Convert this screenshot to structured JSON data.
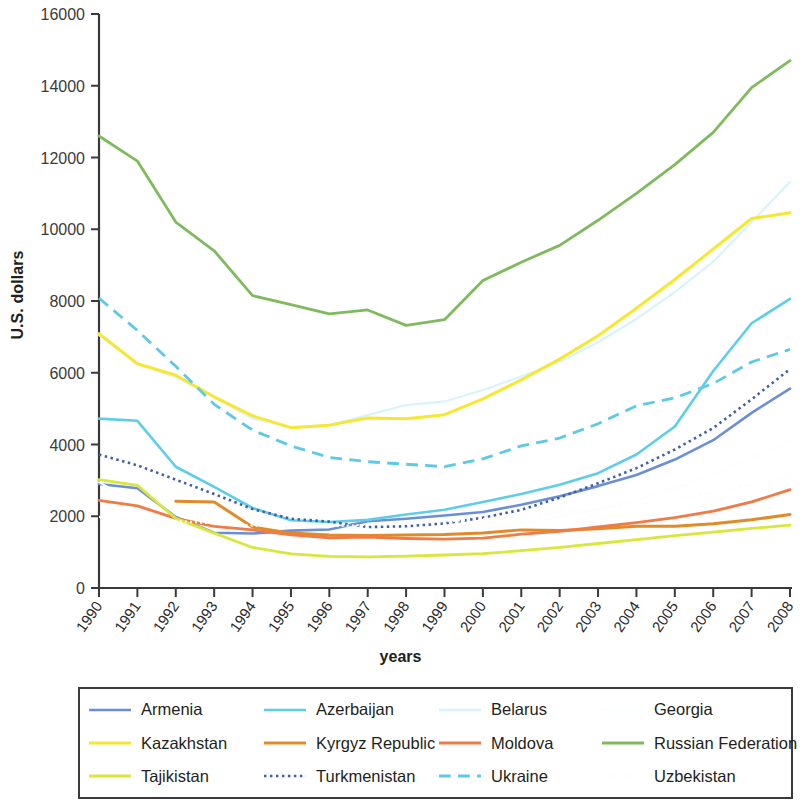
{
  "chart_data": {
    "type": "line",
    "title": "",
    "xlabel": "years",
    "ylabel": "U.S. dollars",
    "x": [
      1990,
      1991,
      1992,
      1993,
      1994,
      1995,
      1996,
      1997,
      1998,
      1999,
      2000,
      2001,
      2002,
      2003,
      2004,
      2005,
      2006,
      2007,
      2008
    ],
    "xtick_labels": [
      "1990",
      "1991",
      "1992",
      "1993",
      "1994",
      "1995",
      "1996",
      "1997",
      "1998",
      "1999",
      "2000",
      "2001",
      "2002",
      "2003",
      "2004",
      "2005",
      "2006",
      "2007",
      "2008"
    ],
    "ytick_labels": [
      "0",
      "2000",
      "4000",
      "6000",
      "8000",
      "10000",
      "12000",
      "14000",
      "16000"
    ],
    "ylim": [
      0,
      16000
    ],
    "ytick_step": 2000,
    "xlim": [
      1990,
      2008
    ],
    "grid": false,
    "legend_position": "bottom",
    "legend_columns": 4,
    "series": [
      {
        "name": "Armenia",
        "color": "#6a8fd8",
        "dash": "solid",
        "width": 2.6,
        "values": [
          2900,
          2780,
          1980,
          1540,
          1520,
          1600,
          1630,
          1860,
          1930,
          2020,
          2120,
          2320,
          2560,
          2840,
          3150,
          3580,
          4120,
          4880,
          5560
        ]
      },
      {
        "name": "Azerbaijan",
        "color": "#5ecdea",
        "dash": "solid",
        "width": 2.6,
        "values": [
          4720,
          4660,
          3380,
          2820,
          2230,
          1890,
          1840,
          1900,
          2050,
          2180,
          2400,
          2620,
          2880,
          3200,
          3720,
          4500,
          6050,
          7380,
          8060
        ]
      },
      {
        "name": "Belarus",
        "color": "#d8f4fb",
        "dash": "solid",
        "width": 2.2,
        "values": [
          7050,
          6250,
          5880,
          5320,
          4720,
          4480,
          4540,
          4820,
          5100,
          5200,
          5520,
          5900,
          6300,
          6850,
          7500,
          8250,
          9100,
          10200,
          11320
        ]
      },
      {
        "name": "Georgia",
        "color": "#fbfefe",
        "dash": "solid",
        "width": 2.0,
        "values": [
          2950,
          2350,
          1560,
          1300,
          1200,
          1230,
          1330,
          1450,
          1540,
          1560,
          1640,
          1800,
          1980,
          2200,
          2450,
          2780,
          3150,
          3620,
          4100
        ]
      },
      {
        "name": "Kazakhstan",
        "color": "#f7e733",
        "dash": "solid",
        "width": 3.0,
        "values": [
          7090,
          6250,
          5930,
          5330,
          4800,
          4470,
          4540,
          4740,
          4720,
          4830,
          5270,
          5800,
          6380,
          7030,
          7800,
          8600,
          9450,
          10300,
          10460
        ]
      },
      {
        "name": "Kyrgyz Republic",
        "color": "#e08b27",
        "dash": "solid",
        "width": 3.0,
        "values": [
          null,
          null,
          2420,
          2400,
          1700,
          1530,
          1480,
          1460,
          1480,
          1490,
          1530,
          1620,
          1600,
          1650,
          1720,
          1720,
          1790,
          1900,
          2050
        ]
      },
      {
        "name": "Moldova",
        "color": "#ef7b45",
        "dash": "solid",
        "width": 2.8,
        "values": [
          2440,
          2290,
          1940,
          1720,
          1620,
          1480,
          1400,
          1420,
          1380,
          1360,
          1390,
          1500,
          1580,
          1700,
          1820,
          1960,
          2140,
          2400,
          2740
        ]
      },
      {
        "name": "Russian Federation",
        "color": "#7fbb5e",
        "dash": "solid",
        "width": 2.8,
        "values": [
          12600,
          11900,
          10200,
          9400,
          8150,
          7900,
          7640,
          7750,
          7320,
          7480,
          8570,
          9080,
          9550,
          10250,
          11000,
          11800,
          12700,
          13950,
          14700
        ]
      },
      {
        "name": "Tajikistan",
        "color": "#d9e63c",
        "dash": "solid",
        "width": 2.8,
        "values": [
          3020,
          2860,
          1940,
          1530,
          1130,
          950,
          880,
          870,
          890,
          920,
          960,
          1040,
          1130,
          1240,
          1350,
          1460,
          1560,
          1660,
          1750
        ]
      },
      {
        "name": "Turkmenistan",
        "color": "#3f5ea8",
        "dash": "dotted",
        "width": 2.6,
        "values": [
          3720,
          3420,
          3020,
          2620,
          2200,
          1930,
          1850,
          1700,
          1720,
          1800,
          1960,
          2180,
          2520,
          2920,
          3340,
          3860,
          4460,
          5260,
          6100
        ]
      },
      {
        "name": "Ukraine",
        "color": "#5ec8e8",
        "dash": "dashed",
        "width": 2.8,
        "values": [
          8080,
          7180,
          6180,
          5120,
          4400,
          3960,
          3640,
          3520,
          3450,
          3380,
          3600,
          3960,
          4180,
          4580,
          5080,
          5300,
          5700,
          6300,
          6650
        ]
      },
      {
        "name": "Uzbekistan",
        "color": "#fdfcf5",
        "dash": "dotted",
        "width": 2.2,
        "values": [
          1980,
          1940,
          1870,
          1800,
          1740,
          1700,
          1720,
          1760,
          1800,
          1860,
          1920,
          2000,
          2090,
          2200,
          2330,
          2480,
          2650,
          2880,
          3120
        ]
      }
    ]
  },
  "axes": {
    "y_title": "U.S. dollars",
    "x_title": "years"
  }
}
